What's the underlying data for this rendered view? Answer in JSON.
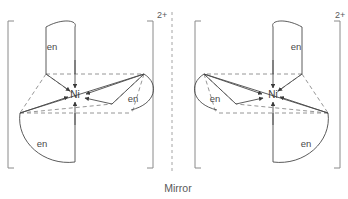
{
  "figure": {
    "title": "",
    "mirror_label": "Mirror",
    "metal_label": "Ni",
    "ligand_label": "en",
    "charge_label": "2+"
  },
  "structures": [
    {
      "id": "left-enantiomer",
      "name": "delta-tris-ethylenediamine-nickel",
      "charge": "2+",
      "metal": "Ni",
      "ligands": [
        {
          "label": "en",
          "position": "top-left"
        },
        {
          "label": "en",
          "position": "right"
        },
        {
          "label": "en",
          "position": "bottom-left"
        }
      ]
    },
    {
      "id": "right-enantiomer",
      "name": "lambda-tris-ethylenediamine-nickel",
      "charge": "2+",
      "metal": "Ni",
      "ligands": [
        {
          "label": "en",
          "position": "top-right"
        },
        {
          "label": "en",
          "position": "left"
        },
        {
          "label": "en",
          "position": "bottom-right"
        }
      ]
    }
  ],
  "colors": {
    "solid_bond": "#4a4a4a",
    "dashed_bond": "#8a8a8a",
    "bracket": "#8a8a8a",
    "mirror_line": "#9a9a9a",
    "text": "#4a4a4a",
    "background": "#ffffff"
  }
}
